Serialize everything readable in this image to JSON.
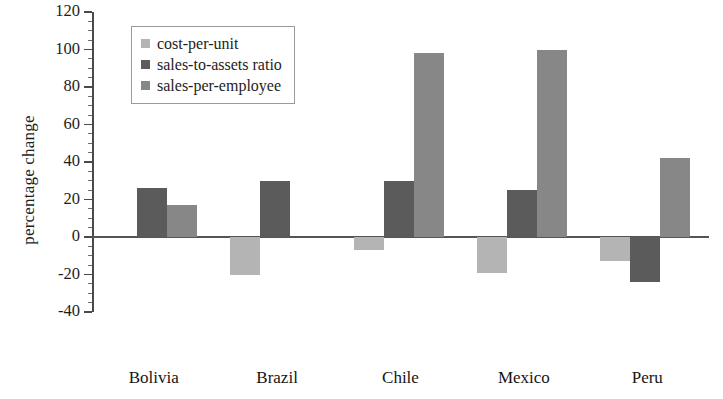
{
  "chart_data": {
    "type": "bar",
    "title": "",
    "subtitle": "",
    "xlabel": "",
    "ylabel": "percentage change",
    "categories": [
      "Bolivia",
      "Brazil",
      "Chile",
      "Mexico",
      "Peru"
    ],
    "series": [
      {
        "name": "cost-per-unit",
        "color": "#b4b4b4",
        "values": [
          0,
          -20,
          -7,
          -19,
          -13
        ]
      },
      {
        "name": "sales-to-assets ratio",
        "color": "#5b5b5b",
        "values": [
          26,
          30,
          30,
          25,
          -24
        ]
      },
      {
        "name": "sales-per-employee",
        "color": "#878787",
        "values": [
          17,
          0,
          98,
          100,
          42
        ]
      }
    ],
    "ylim": [
      -40,
      120
    ],
    "ytick_labels": [
      "120",
      "100",
      "80",
      "60",
      "40",
      "20",
      "0",
      "-20",
      "-40"
    ],
    "ytick_values": [
      120,
      100,
      80,
      60,
      40,
      20,
      0,
      -20,
      -40
    ],
    "ytick_minor_step": 5,
    "grid": false,
    "legend_position": "top-left",
    "legend_entries": [
      "cost-per-unit",
      "sales-to-assets ratio",
      "sales-per-employee"
    ]
  }
}
